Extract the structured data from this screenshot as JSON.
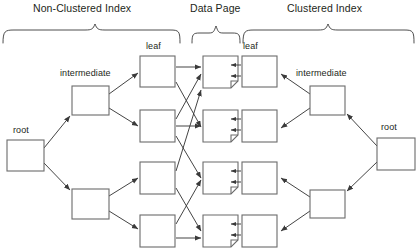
{
  "diagram": {
    "type": "b-tree-index-diagram",
    "background_color": "#ffffff",
    "line_color": "#3a3a3a",
    "text_color": "#231f20",
    "sections": [
      {
        "id": "non-clustered",
        "label": "Non-Clustered Index",
        "label_x": 100,
        "label_y": 10,
        "bracket_x1": 3,
        "bracket_x2": 180,
        "bracket_y": 24
      },
      {
        "id": "data-page",
        "label": "Data Page",
        "label_x": 216,
        "label_y": 10,
        "bracket_x1": 192,
        "bracket_x2": 240,
        "bracket_y": 24
      },
      {
        "id": "clustered",
        "label": "Clustered Index",
        "label_x": 329,
        "label_y": 10,
        "bracket_x1": 243,
        "bracket_x2": 414,
        "bracket_y": 24
      }
    ],
    "node_labels": [
      {
        "id": "leaf-left",
        "text": "leaf",
        "x": 157,
        "y": 47
      },
      {
        "id": "leaf-right",
        "text": "leaf",
        "x": 252,
        "y": 47
      },
      {
        "id": "intermediate-left",
        "text": "intermediate",
        "x": 90,
        "y": 74
      },
      {
        "id": "intermediate-right",
        "text": "intermediate",
        "x": 328,
        "y": 74
      },
      {
        "id": "root-left",
        "text": "root",
        "x": 24,
        "y": 130
      },
      {
        "id": "root-right",
        "text": "root",
        "x": 392,
        "y": 127
      }
    ],
    "boxes": [
      {
        "id": "nc-root",
        "group": "non-clustered",
        "kind": "root",
        "x": 7,
        "y": 140,
        "w": 37,
        "h": 31
      },
      {
        "id": "nc-intermediate-1",
        "group": "non-clustered",
        "kind": "intermediate",
        "x": 72,
        "y": 86,
        "w": 37,
        "h": 29
      },
      {
        "id": "nc-intermediate-2",
        "group": "non-clustered",
        "kind": "intermediate",
        "x": 72,
        "y": 189,
        "w": 37,
        "h": 30
      },
      {
        "id": "nc-leaf-1",
        "group": "non-clustered",
        "kind": "leaf",
        "x": 140,
        "y": 56,
        "w": 35,
        "h": 31
      },
      {
        "id": "nc-leaf-2",
        "group": "non-clustered",
        "kind": "leaf",
        "x": 140,
        "y": 110,
        "w": 35,
        "h": 32
      },
      {
        "id": "nc-leaf-3",
        "group": "non-clustered",
        "kind": "leaf",
        "x": 140,
        "y": 162,
        "w": 35,
        "h": 32
      },
      {
        "id": "nc-leaf-4",
        "group": "non-clustered",
        "kind": "leaf",
        "x": 140,
        "y": 215,
        "w": 35,
        "h": 32
      },
      {
        "id": "dp-1",
        "group": "data-page",
        "kind": "data-page",
        "x": 203,
        "y": 56,
        "w": 35,
        "h": 32
      },
      {
        "id": "dp-2",
        "group": "data-page",
        "kind": "data-page",
        "x": 203,
        "y": 110,
        "w": 35,
        "h": 32
      },
      {
        "id": "dp-3",
        "group": "data-page",
        "kind": "data-page",
        "x": 203,
        "y": 162,
        "w": 35,
        "h": 32
      },
      {
        "id": "dp-4",
        "group": "data-page",
        "kind": "data-page",
        "x": 203,
        "y": 215,
        "w": 35,
        "h": 32
      },
      {
        "id": "c-leaf-1",
        "group": "clustered",
        "kind": "leaf",
        "x": 242,
        "y": 56,
        "w": 35,
        "h": 31
      },
      {
        "id": "c-leaf-2",
        "group": "clustered",
        "kind": "leaf",
        "x": 242,
        "y": 110,
        "w": 35,
        "h": 32
      },
      {
        "id": "c-leaf-3",
        "group": "clustered",
        "kind": "leaf",
        "x": 242,
        "y": 162,
        "w": 35,
        "h": 32
      },
      {
        "id": "c-leaf-4",
        "group": "clustered",
        "kind": "leaf",
        "x": 242,
        "y": 215,
        "w": 35,
        "h": 32
      },
      {
        "id": "c-intermediate-1",
        "group": "clustered",
        "kind": "intermediate",
        "x": 310,
        "y": 86,
        "w": 35,
        "h": 29
      },
      {
        "id": "c-intermediate-2",
        "group": "clustered",
        "kind": "intermediate",
        "x": 310,
        "y": 190,
        "w": 35,
        "h": 28
      },
      {
        "id": "c-root",
        "group": "clustered",
        "kind": "root",
        "x": 377,
        "y": 138,
        "w": 38,
        "h": 32
      }
    ],
    "connectors": [
      {
        "from": "nc-root",
        "to": "nc-intermediate-1",
        "style": "arrow"
      },
      {
        "from": "nc-root",
        "to": "nc-intermediate-2",
        "style": "arrow"
      },
      {
        "from": "nc-intermediate-1",
        "to": "nc-leaf-1",
        "style": "arrow"
      },
      {
        "from": "nc-intermediate-1",
        "to": "nc-leaf-2",
        "style": "arrow"
      },
      {
        "from": "nc-intermediate-2",
        "to": "nc-leaf-3",
        "style": "arrow"
      },
      {
        "from": "nc-intermediate-2",
        "to": "nc-leaf-4",
        "style": "arrow"
      },
      {
        "from": "nc-leaf-1",
        "to": "dp-2",
        "style": "arrow-cross"
      },
      {
        "from": "nc-leaf-2",
        "to": "dp-1",
        "style": "arrow-cross"
      },
      {
        "from": "nc-leaf-3",
        "to": "dp-4",
        "style": "arrow-cross"
      },
      {
        "from": "nc-leaf-4",
        "to": "dp-3",
        "style": "arrow-cross"
      },
      {
        "from": "nc-leaf-2",
        "to": "dp-3",
        "style": "arrow-cross"
      },
      {
        "from": "nc-leaf-4",
        "to": "dp-1",
        "style": "arrow-cross"
      },
      {
        "from": "c-leaf-1",
        "to": "dp-1",
        "style": "double-arrow-left"
      },
      {
        "from": "c-leaf-2",
        "to": "dp-2",
        "style": "double-arrow-left"
      },
      {
        "from": "c-leaf-3",
        "to": "dp-3",
        "style": "double-arrow-left"
      },
      {
        "from": "c-leaf-4",
        "to": "dp-4",
        "style": "double-arrow-left"
      },
      {
        "from": "c-intermediate-1",
        "to": "c-leaf-1",
        "style": "arrow"
      },
      {
        "from": "c-intermediate-1",
        "to": "c-leaf-2",
        "style": "arrow"
      },
      {
        "from": "c-intermediate-2",
        "to": "c-leaf-3",
        "style": "arrow"
      },
      {
        "from": "c-intermediate-2",
        "to": "c-leaf-4",
        "style": "arrow"
      },
      {
        "from": "c-root",
        "to": "c-intermediate-1",
        "style": "arrow"
      },
      {
        "from": "c-root",
        "to": "c-intermediate-2",
        "style": "arrow"
      }
    ]
  }
}
